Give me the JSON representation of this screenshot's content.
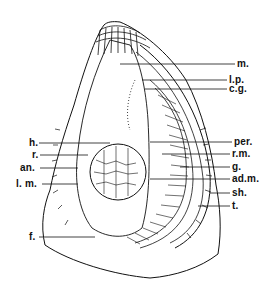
{
  "figure": {
    "line_color": "#111111",
    "background": "#ffffff"
  },
  "labels_right": [
    {
      "id": "m",
      "text": "m.",
      "x": 237,
      "y": 64,
      "line_from": [
        120,
        64
      ]
    },
    {
      "id": "lp",
      "text": "l.p.",
      "x": 229,
      "y": 80,
      "line_from": [
        142,
        80
      ]
    },
    {
      "id": "cg",
      "text": "c.g.",
      "x": 229,
      "y": 89,
      "line_from": [
        145,
        89
      ]
    },
    {
      "id": "per",
      "text": "per.",
      "x": 234,
      "y": 142,
      "line_from": [
        150,
        142
      ]
    },
    {
      "id": "rm",
      "text": "r.m.",
      "x": 232,
      "y": 154,
      "line_from": [
        162,
        154
      ]
    },
    {
      "id": "g",
      "text": "g.",
      "x": 232,
      "y": 167,
      "line_from": [
        180,
        167
      ]
    },
    {
      "id": "adm",
      "text": "ad.m.",
      "x": 232,
      "y": 179,
      "line_from": [
        150,
        179
      ]
    },
    {
      "id": "sh",
      "text": "sh.",
      "x": 232,
      "y": 193,
      "line_from": [
        210,
        193
      ]
    },
    {
      "id": "t",
      "text": "t.",
      "x": 232,
      "y": 206,
      "line_from": [
        198,
        206
      ]
    }
  ],
  "labels_left": [
    {
      "id": "h",
      "text": "h.",
      "x": 29,
      "y": 143,
      "line_to": [
        110,
        143
      ]
    },
    {
      "id": "r",
      "text": "r.",
      "x": 32,
      "y": 155,
      "line_to": [
        88,
        155
      ]
    },
    {
      "id": "an",
      "text": "an.",
      "x": 20,
      "y": 168,
      "line_to": [
        78,
        168
      ]
    },
    {
      "id": "lm",
      "text": "l. m.",
      "x": 16,
      "y": 184,
      "line_to": [
        78,
        184
      ]
    },
    {
      "id": "f",
      "text": "f.",
      "x": 29,
      "y": 237,
      "line_to": [
        95,
        237
      ]
    }
  ]
}
